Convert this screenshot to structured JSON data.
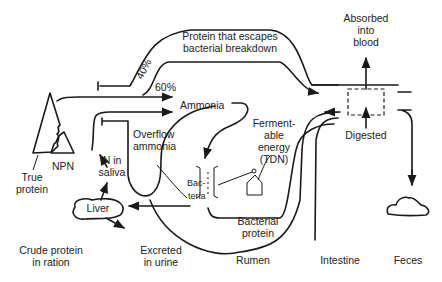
{
  "diagram": {
    "labels": {
      "escape_line1": "Protein that escapes",
      "escape_line2": "bacterial breakdown",
      "pct_40": "40%",
      "pct_60": "60%",
      "ammonia": "Ammonia",
      "overflow_line1": "Overflow",
      "overflow_line2": "ammonia",
      "fermentable_line1": "Ferment-",
      "fermentable_line2": "able",
      "fermentable_line3": "energy",
      "fermentable_line4": "(TDN)",
      "bacteria_line1": "Bac-",
      "bacteria_line2": "teria",
      "bacterial_protein_line1": "Bacterial",
      "bacterial_protein_line2": "protein",
      "absorbed_line1": "Absorbed",
      "absorbed_line2": "into",
      "absorbed_line3": "blood",
      "digested": "Digested",
      "true_protein_line1": "True",
      "true_protein_line2": "protein",
      "npn": "NPN",
      "n_saliva_line1": "N in",
      "n_saliva_line2": "saliva",
      "liver": "Liver",
      "excreted_line1": "Excreted",
      "excreted_line2": "in urine"
    },
    "sections": [
      {
        "line1": "Crude protein",
        "line2": "in ration"
      },
      {
        "line1": "Excreted",
        "line2": "in urine"
      },
      {
        "line1": "Rumen",
        "line2": ""
      },
      {
        "line1": "Intestine",
        "line2": ""
      },
      {
        "line1": "Feces",
        "line2": ""
      }
    ]
  }
}
